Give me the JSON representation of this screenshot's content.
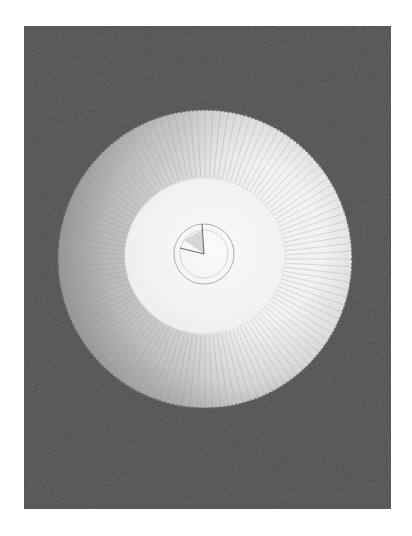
{
  "image": {
    "subject": "Conical hat viewed from above",
    "background_color": "#4a4a4a",
    "frame_color": "#ffffff",
    "rim_color": "#d8d8d8",
    "crown_color": "#f6f6f6",
    "shadow_color": "#a8a8a8"
  }
}
